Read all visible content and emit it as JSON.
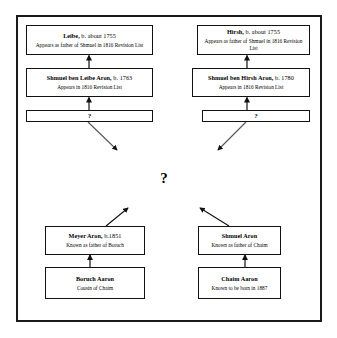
{
  "diagram": {
    "type": "genealogy-tree",
    "frame_color": "#1a1a1a",
    "background": "#ffffff",
    "center_unknown": "?",
    "nodes": [
      {
        "id": "leibe",
        "title": "Leibe,",
        "title_suffix": " b. about 1755",
        "note": "Appears as father of Shmuel in 1816 Revision List"
      },
      {
        "id": "hirsh",
        "title": "Hirsh,",
        "title_suffix": " b. about 1755",
        "note": "Appears as father of Shmuel in 1816 Revision List"
      },
      {
        "id": "shmuel-ben-leibe",
        "title": "Shmuel ben Leibe Aron,",
        "title_suffix": " b. 1763",
        "note": "Appears in 1816 Revision List"
      },
      {
        "id": "shmuel-ben-hirsh",
        "title": "Shmuel ben Hirsh Aron,",
        "title_suffix": " b. 1780",
        "note": "Appears in 1816 Revision List"
      },
      {
        "id": "unknown-left",
        "title": "?",
        "title_suffix": "",
        "note": ""
      },
      {
        "id": "unknown-right",
        "title": "?",
        "title_suffix": "",
        "note": ""
      },
      {
        "id": "meyer-aron",
        "title": "Meyer Aron,",
        "title_suffix": "  b.1851",
        "note": "Known as  father of Boruch"
      },
      {
        "id": "shmuel-aron",
        "title": "Shmuel Aron",
        "title_suffix": "",
        "note": "Known as  father of Chaim"
      },
      {
        "id": "boruch-aaron",
        "title": "Boruch Aaron",
        "title_suffix": "",
        "note": "Cousin of Chaim"
      },
      {
        "id": "chaim-aaron",
        "title": "Chaim Aaron",
        "title_suffix": "",
        "note": "Known to be born in 1887"
      }
    ]
  }
}
